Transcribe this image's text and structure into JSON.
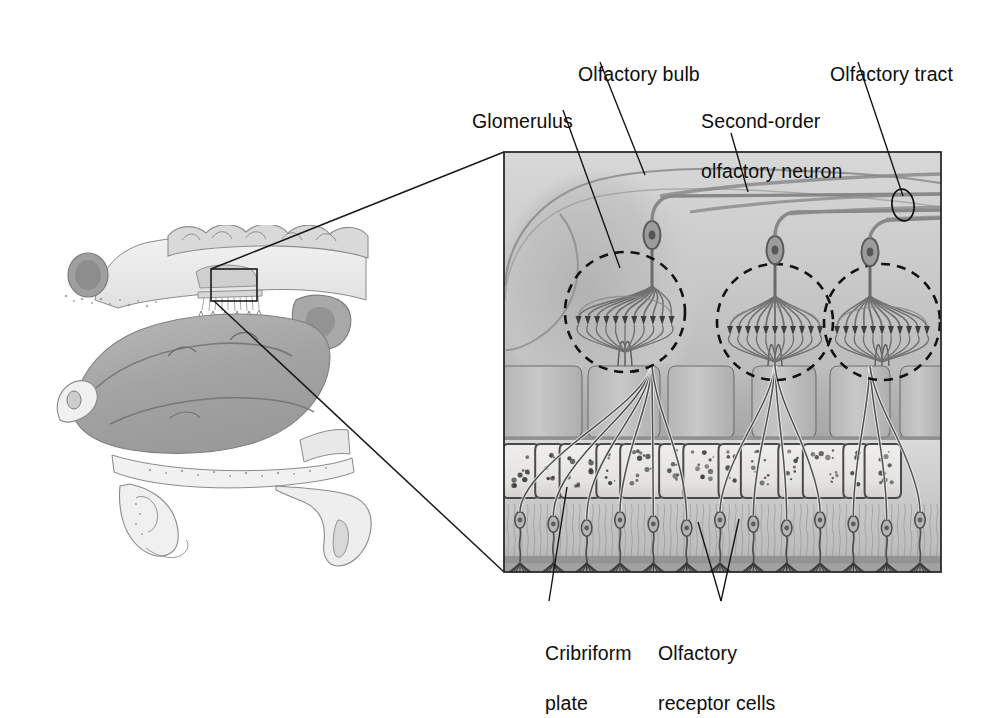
{
  "figure": {
    "background": "#ffffff",
    "ink": "#0d0d0d"
  },
  "labels": [
    {
      "id": "glomerulus",
      "text": "Glomerulus",
      "x": 450,
      "y": 84,
      "lines": [
        "Glomerulus"
      ]
    },
    {
      "id": "olfactory-bulb",
      "text": "Olfactory bulb",
      "x": 556,
      "y": 37,
      "lines": [
        "Olfactory bulb"
      ]
    },
    {
      "id": "second-order",
      "text": "Second-order olfactory neuron",
      "x": 679,
      "y": 84,
      "lines": [
        "Second-order",
        "olfactory neuron"
      ]
    },
    {
      "id": "olfactory-tract",
      "text": "Olfactory tract",
      "x": 808,
      "y": 37,
      "lines": [
        "Olfactory tract"
      ]
    },
    {
      "id": "cribriform-plate",
      "text": "Cribriform plate",
      "x": 523,
      "y": 616,
      "lines": [
        "Cribriform",
        "plate"
      ]
    },
    {
      "id": "receptor-cells",
      "text": "Olfactory receptor cells",
      "x": 636,
      "y": 616,
      "lines": [
        "Olfactory",
        "receptor cells"
      ]
    }
  ],
  "leaders": [
    {
      "id": "leader-glomerulus",
      "from": [
        563,
        110
      ],
      "to": [
        620,
        268
      ]
    },
    {
      "id": "leader-olfactory-bulb",
      "from": [
        600,
        62
      ],
      "to": [
        645,
        175
      ]
    },
    {
      "id": "leader-second-order",
      "from": [
        731,
        133
      ],
      "to": [
        748,
        192
      ]
    },
    {
      "id": "leader-olfactory-tract",
      "from": [
        858,
        62
      ],
      "to": [
        903,
        196
      ]
    },
    {
      "id": "leader-cribriform",
      "from": [
        567,
        487
      ],
      "to": [
        549,
        601
      ]
    },
    {
      "id": "leader-receptors-left",
      "from": [
        698,
        522
      ],
      "to": [
        721,
        601
      ]
    },
    {
      "id": "leader-receptors-right",
      "from": [
        739,
        519
      ],
      "to": [
        721,
        601
      ]
    }
  ],
  "callout": {
    "box": {
      "x": 211,
      "y": 269,
      "w": 46,
      "h": 32
    },
    "ray_top": {
      "from": [
        211,
        269
      ],
      "to": [
        504,
        152
      ]
    },
    "ray_bottom": {
      "from": [
        214,
        301
      ],
      "to": [
        504,
        572
      ]
    }
  },
  "inset": {
    "x": 504,
    "y": 152,
    "w": 437,
    "h": 420,
    "border_color": "#2b2b2b",
    "bands": [
      {
        "id": "olfactory-bulb-tissue",
        "top": 0,
        "height": 212,
        "fill": "#cfcfcf"
      },
      {
        "id": "lamina-propria",
        "top": 212,
        "height": 76,
        "fill": "#b9b9b9"
      },
      {
        "id": "cribriform-bone",
        "top": 288,
        "height": 62,
        "fill": "#dcdcdc"
      },
      {
        "id": "olfactory-epithelium",
        "top": 350,
        "height": 70,
        "fill": "#c4c4c4"
      }
    ],
    "glomeruli": [
      {
        "id": "glomerulus-1",
        "cx": 625,
        "cy": 312,
        "r": 60
      },
      {
        "id": "glomerulus-2",
        "cx": 775,
        "cy": 322,
        "r": 58
      },
      {
        "id": "glomerulus-3",
        "cx": 882,
        "cy": 322,
        "r": 58
      }
    ],
    "mitral_cells": [
      {
        "id": "mitral-cell-1",
        "soma_x": 652,
        "soma_y": 235,
        "axon_turn_y": 196
      },
      {
        "id": "mitral-cell-2",
        "soma_x": 775,
        "soma_y": 250,
        "axon_turn_y": 212
      },
      {
        "id": "mitral-cell-3",
        "soma_x": 870,
        "soma_y": 252,
        "axon_turn_y": 220
      }
    ],
    "tract_lines_y": [
      178,
      196,
      208,
      216
    ],
    "tract_marker": {
      "cx": 903,
      "cy": 205,
      "rx": 11,
      "ry": 16
    },
    "bone_block_count": 13,
    "receptor_cell_count": 13
  },
  "sagittal": {
    "id": "sagittal-head-section",
    "x": 38,
    "y": 232,
    "w": 330,
    "h": 340,
    "structures": [
      "frontal sinus",
      "cerebral cortex",
      "cribriform plate region",
      "superior nasal concha",
      "middle nasal concha",
      "inferior nasal concha",
      "sphenoid sinus",
      "nasopharynx",
      "hard palate",
      "soft palate",
      "tongue"
    ]
  },
  "palette": {
    "paper": "#ffffff",
    "ink": "#0d0d0d",
    "tissue_light": "#e3e3e3",
    "tissue_mid": "#c6c6c6",
    "tissue_dark": "#9a9a9a",
    "bone": "#e8e8e6",
    "outline": "#5a5a5a",
    "dashed": "#111111"
  }
}
